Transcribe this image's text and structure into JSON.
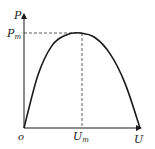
{
  "figure": {
    "y_axis_label": "P",
    "x_axis_label": "U",
    "origin_label": "o",
    "peak_y_label": {
      "base": "P",
      "sub": "m"
    },
    "peak_x_label": {
      "base": "U",
      "sub": "m"
    },
    "colors": {
      "line": "#1a1a1a",
      "dash": "#333333"
    }
  },
  "chart_data": {
    "type": "line",
    "title": "",
    "xlabel": "U",
    "ylabel": "P",
    "points_normalized": [
      [
        0,
        0
      ],
      [
        0.25,
        0.56
      ],
      [
        0.5,
        0.87
      ],
      [
        0.75,
        0.98
      ],
      [
        1.0,
        1.0
      ],
      [
        1.25,
        0.95
      ],
      [
        1.5,
        0.78
      ],
      [
        1.75,
        0.47
      ],
      [
        2.0,
        0.0
      ]
    ],
    "x_unit": "Um",
    "y_unit": "Pm",
    "annotations": [
      "Pm",
      "Um"
    ],
    "grid": false
  }
}
